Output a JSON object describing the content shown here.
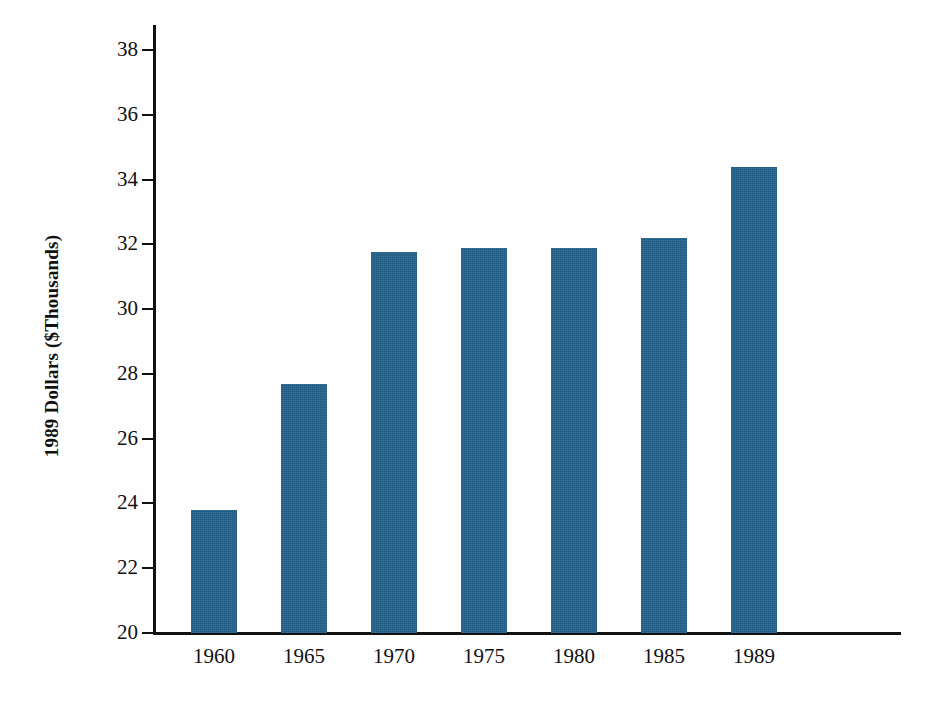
{
  "chart_data": {
    "type": "bar",
    "title": "",
    "subtitle": "",
    "xlabel": "",
    "ylabel": "1989 Dollars ($Thousands)",
    "categories": [
      "1960",
      "1965",
      "1970",
      "1975",
      "1980",
      "1985",
      "1989"
    ],
    "values": [
      23.8,
      27.7,
      31.75,
      31.9,
      31.9,
      32.2,
      34.4
    ],
    "series": [
      {
        "name": "1989 Dollars ($Thousands)",
        "values": [
          23.8,
          27.7,
          31.75,
          31.9,
          31.9,
          32.2,
          34.4
        ]
      }
    ],
    "ylim": [
      20,
      38
    ],
    "ytick_labels": [
      "38",
      "36",
      "34",
      "32",
      "30",
      "28",
      "26",
      "24",
      "22",
      "20"
    ],
    "ytick_values": [
      38,
      36,
      34,
      32,
      30,
      28,
      26,
      24,
      22,
      20
    ],
    "ytick_step": 2,
    "grid": false,
    "legend": false,
    "legend_position": "none",
    "bar_color": "#205C84",
    "axis_color": "#111111",
    "background_color": "#FFFFFF",
    "bar_orientation": "vertical"
  }
}
